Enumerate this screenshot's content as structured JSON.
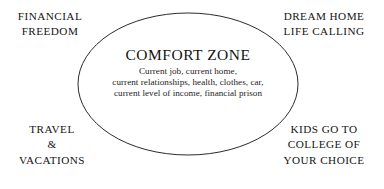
{
  "diagram": {
    "type": "venn-single-ellipse",
    "background_color": "#ffffff",
    "ellipse": {
      "name": "comfort-zone-ellipse",
      "stroke_color": "#2b2b2b",
      "fill": "none",
      "stroke_width": 1,
      "center_x": 188,
      "center_y": 84,
      "radius_x": 110,
      "radius_y": 71
    },
    "center": {
      "title": "COMFORT ZONE",
      "items": [
        "Current job, current home,",
        "current relationships, health, clothes, car,",
        "current level of income, financial prison"
      ]
    },
    "corners": [
      {
        "id": "financial-freedom",
        "position": "top-left",
        "lines": [
          "FINANCIAL",
          "FREEDOM"
        ]
      },
      {
        "id": "dream-home-life-calling",
        "position": "top-right",
        "lines": [
          "DREAM HOME",
          "LIFE CALLING"
        ]
      },
      {
        "id": "travel-vacations",
        "position": "bottom-left",
        "lines": [
          "TRAVEL",
          "&",
          "VACATIONS"
        ]
      },
      {
        "id": "kids-college",
        "position": "bottom-right",
        "lines": [
          "KIDS GO TO",
          "COLLEGE OF",
          "YOUR CHOICE"
        ]
      }
    ]
  }
}
